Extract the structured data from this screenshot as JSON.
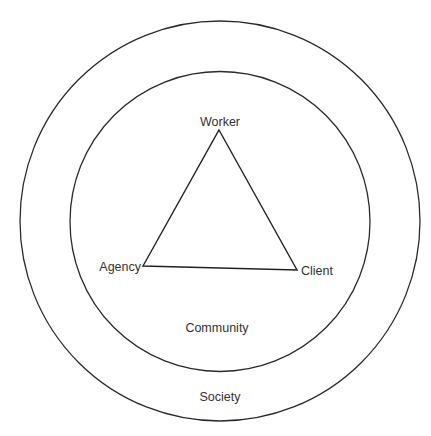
{
  "diagram": {
    "title": "",
    "rings": [
      {
        "id": "society",
        "label": "Society",
        "cx": 220,
        "cy": 221,
        "r": 200
      },
      {
        "id": "community",
        "label": "Community",
        "cx": 220,
        "cy": 221.5,
        "r": 150
      }
    ],
    "triangle": {
      "vertices": [
        {
          "id": "worker",
          "label": "Worker",
          "x": 219,
          "y": 130
        },
        {
          "id": "agency",
          "label": "Agency",
          "x": 143,
          "y": 266
        },
        {
          "id": "client",
          "label": "Client",
          "x": 297,
          "y": 270
        }
      ],
      "edges": [
        [
          "worker",
          "client"
        ],
        [
          "client",
          "agency"
        ],
        [
          "agency",
          "worker"
        ]
      ]
    },
    "labels": {
      "worker": "Worker",
      "agency": "Agency",
      "client": "Client",
      "community": "Community",
      "society": "Society"
    },
    "colors": {
      "line": "#2a2a2a",
      "text": "#333333",
      "background": "#ffffff"
    }
  }
}
